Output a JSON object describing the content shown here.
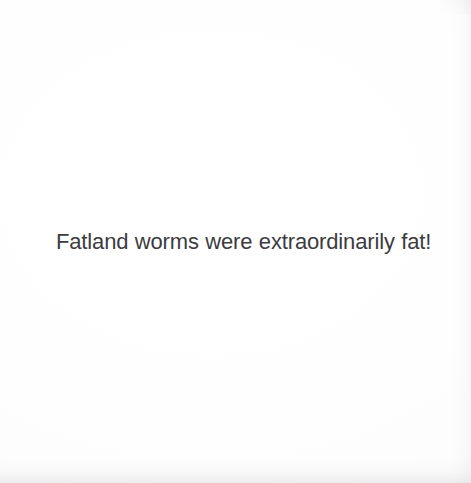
{
  "page": {
    "kind": "scanned-book-page",
    "background_color": "#fdfdfd",
    "width_px": 471,
    "height_px": 483
  },
  "content": {
    "body_text": "Fatland worms were extraordinarily fat!"
  },
  "typography": {
    "text_color": "#3c3c40",
    "font_size_px": 22
  }
}
